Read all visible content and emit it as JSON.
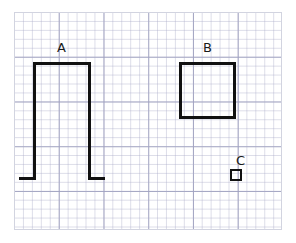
{
  "figure": {
    "title": "",
    "background_color": "#ffffff",
    "stroke_color": "#111111",
    "grid_minor_color": "#aaacc8",
    "grid_major_color": "#9698b9",
    "border_color": "#d2d4e0"
  },
  "grid": {
    "x": 14,
    "y": 12,
    "width": 268,
    "height": 218,
    "minor_spacing": 8.95,
    "major_spacing": 44.75,
    "minor_per_major": 5
  },
  "shapes": [
    {
      "id": "A",
      "label": "A",
      "type": "open-bracket",
      "description": "Inverted U bracket with short outward feet at the bottom",
      "label_x": 57,
      "label_y": 41,
      "left": 33,
      "right": 91,
      "top": 62,
      "bottom": 180,
      "width": 58,
      "height": 118,
      "stroke_width": 3,
      "foot_left_extent": 14,
      "foot_right_extent": 14
    },
    {
      "id": "B",
      "label": "B",
      "type": "square",
      "description": "Closed square outline",
      "label_x": 203,
      "label_y": 41,
      "left": 179,
      "right": 236,
      "top": 62,
      "bottom": 119,
      "width": 57,
      "height": 57,
      "stroke_width": 3
    },
    {
      "id": "C",
      "label": "C",
      "type": "square",
      "description": "Small closed square outline",
      "label_x": 236,
      "label_y": 154,
      "left": 230,
      "right": 242,
      "top": 169,
      "bottom": 181,
      "width": 12,
      "height": 12,
      "stroke_width": 2
    }
  ]
}
